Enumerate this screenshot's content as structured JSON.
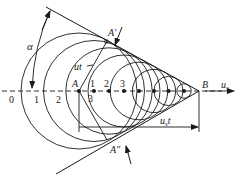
{
  "diagram": {
    "type": "mach-cone-wavefronts",
    "axis_label": "u",
    "axis_label_sub": "s",
    "apex_label": "B",
    "source_label": "A",
    "upper_tangent_label": "A′",
    "lower_tangent_label": "A″",
    "angle_label": "α",
    "wave_radius_label": "ut",
    "travel_label": "u",
    "travel_label_sub": "s",
    "travel_label_suffix": "t",
    "left_ticks": [
      "0",
      "1",
      "2"
    ],
    "right_ticks": [
      "1",
      "2",
      "3"
    ],
    "below_tick": "3"
  }
}
